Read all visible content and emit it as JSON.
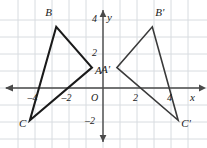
{
  "figure": {
    "type": "coordinate-plane-geometry",
    "background_color": "#ffffff",
    "grid_color": "#d8dce0",
    "axis_color": "#4a4a4a",
    "shape_color": "#1a1a1a",
    "image_shape_color": "#3a3a3a"
  },
  "axes": {
    "x_label": "x",
    "y_label": "y",
    "origin_label": "O",
    "x_ticks": [
      {
        "value": -4,
        "label": "4",
        "show_minus_glyph": true
      },
      {
        "value": -2,
        "label": "2",
        "show_minus_glyph": true
      },
      {
        "value": 2,
        "label": "2",
        "show_minus_glyph": false
      },
      {
        "value": 4,
        "label": "4",
        "show_minus_glyph": false
      }
    ],
    "y_ticks": [
      {
        "value": 4,
        "label": "4",
        "show_minus_glyph": false
      },
      {
        "value": 2,
        "label": "2",
        "show_minus_glyph": false
      },
      {
        "value": -2,
        "label": "2",
        "show_minus_glyph": true
      }
    ],
    "x_range": [
      -5.9,
      5.9
    ],
    "y_range": [
      -3.4,
      4.5
    ],
    "unit_px": 17,
    "origin_px": {
      "x": 103,
      "y": 88
    },
    "grid_enabled": true
  },
  "shapes": [
    {
      "name": "triangle-abc",
      "id": "preimage",
      "vertices": [
        {
          "label": "A",
          "x": -0.65,
          "y": 1.2,
          "label_dx": 3,
          "label_dy": 3
        },
        {
          "label": "B",
          "x": -2.75,
          "y": 3.6,
          "label_dx": -11,
          "label_dy": -14
        },
        {
          "label": "C",
          "x": -4.3,
          "y": -1.9,
          "label_dx": -11,
          "label_dy": 4
        }
      ],
      "stroke_width": 2.1
    },
    {
      "name": "triangle-a-prime-b-prime-c-prime",
      "id": "image",
      "vertices": [
        {
          "label": "A'",
          "x": 0.82,
          "y": 1.2,
          "label_dx": -16,
          "label_dy": 2
        },
        {
          "label": "B'",
          "x": 2.9,
          "y": 3.6,
          "label_dx": 3,
          "label_dy": -14
        },
        {
          "label": "C'",
          "x": 4.42,
          "y": -1.9,
          "label_dx": 3,
          "label_dy": 4
        }
      ],
      "stroke_width": 1.6
    }
  ]
}
